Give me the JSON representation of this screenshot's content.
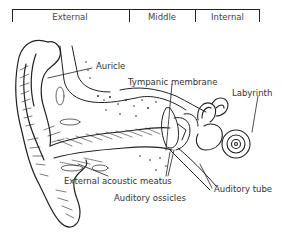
{
  "diagram": {
    "regions": [
      {
        "label": "External"
      },
      {
        "label": "Middle"
      },
      {
        "label": "Internal"
      }
    ],
    "labels": {
      "auricle": "Auricle",
      "tympanic_membrane": "Tympanic membrane",
      "labyrinth": "Labyrinth",
      "external_acoustic_meatus": "External acoustic meatus",
      "auditory_ossicles": "Auditory ossicles",
      "auditory_tube": "Auditory tube"
    },
    "colors": {
      "ink": "#222222",
      "background": "#ffffff"
    }
  }
}
